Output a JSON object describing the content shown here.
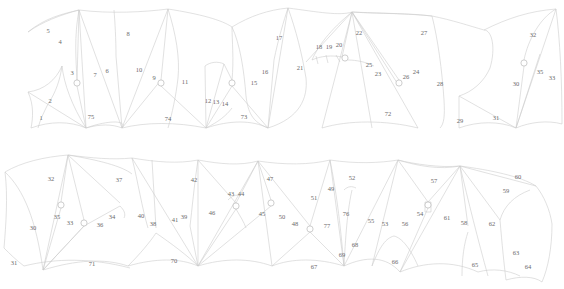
{
  "diagram": {
    "type": "panel-layout-drawing",
    "background_color": "#ffffff",
    "line_color": "#c9c9c9",
    "seam_color": "#a9a9a9",
    "label_color": "#6a6a6a",
    "width": 564,
    "height": 289,
    "rows": [
      {
        "name": "upper-row",
        "label": "Upper panel row"
      },
      {
        "name": "lower-row",
        "label": "Lower panel row"
      }
    ],
    "labels": [
      {
        "id": "1",
        "text": "1",
        "x": 41,
        "y": 118,
        "row": "upper-row"
      },
      {
        "id": "2",
        "text": "2",
        "x": 50,
        "y": 101,
        "row": "upper-row"
      },
      {
        "id": "3",
        "text": "3",
        "x": 72,
        "y": 73,
        "row": "upper-row"
      },
      {
        "id": "4",
        "text": "4",
        "x": 60,
        "y": 42,
        "row": "upper-row"
      },
      {
        "id": "5",
        "text": "5",
        "x": 48,
        "y": 31,
        "row": "upper-row"
      },
      {
        "id": "6",
        "text": "6",
        "x": 107,
        "y": 71,
        "row": "upper-row"
      },
      {
        "id": "7",
        "text": "7",
        "x": 95,
        "y": 75,
        "row": "upper-row"
      },
      {
        "id": "8",
        "text": "8",
        "x": 128,
        "y": 34,
        "row": "upper-row"
      },
      {
        "id": "9",
        "text": "9",
        "x": 154,
        "y": 78,
        "row": "upper-row"
      },
      {
        "id": "10",
        "text": "10",
        "x": 139,
        "y": 70,
        "row": "upper-row"
      },
      {
        "id": "11",
        "text": "11",
        "x": 185,
        "y": 82,
        "row": "upper-row"
      },
      {
        "id": "12",
        "text": "12",
        "x": 208,
        "y": 101,
        "row": "upper-row"
      },
      {
        "id": "13",
        "text": "13",
        "x": 216,
        "y": 102,
        "row": "upper-row"
      },
      {
        "id": "14",
        "text": "14",
        "x": 225,
        "y": 104,
        "row": "upper-row"
      },
      {
        "id": "15",
        "text": "15",
        "x": 254,
        "y": 83,
        "row": "upper-row"
      },
      {
        "id": "16",
        "text": "16",
        "x": 265,
        "y": 72,
        "row": "upper-row"
      },
      {
        "id": "17",
        "text": "17",
        "x": 279,
        "y": 38,
        "row": "upper-row"
      },
      {
        "id": "18",
        "text": "18",
        "x": 319,
        "y": 47,
        "row": "upper-row"
      },
      {
        "id": "19",
        "text": "19",
        "x": 329,
        "y": 47,
        "row": "upper-row"
      },
      {
        "id": "20",
        "text": "20",
        "x": 339,
        "y": 45,
        "row": "upper-row"
      },
      {
        "id": "21",
        "text": "21",
        "x": 300,
        "y": 68,
        "row": "upper-row"
      },
      {
        "id": "22",
        "text": "22",
        "x": 359,
        "y": 33,
        "row": "upper-row"
      },
      {
        "id": "23",
        "text": "23",
        "x": 378,
        "y": 74,
        "row": "upper-row"
      },
      {
        "id": "24",
        "text": "24",
        "x": 416,
        "y": 72,
        "row": "upper-row"
      },
      {
        "id": "25",
        "text": "25",
        "x": 369,
        "y": 65,
        "row": "upper-row"
      },
      {
        "id": "26",
        "text": "26",
        "x": 406,
        "y": 77,
        "row": "upper-row"
      },
      {
        "id": "27",
        "text": "27",
        "x": 424,
        "y": 33,
        "row": "upper-row"
      },
      {
        "id": "28",
        "text": "28",
        "x": 440,
        "y": 84,
        "row": "upper-row"
      },
      {
        "id": "29",
        "text": "29",
        "x": 460,
        "y": 121,
        "row": "upper-row"
      },
      {
        "id": "30",
        "text": "30",
        "x": 516,
        "y": 84,
        "row": "upper-row"
      },
      {
        "id": "31",
        "text": "31",
        "x": 496,
        "y": 118,
        "row": "upper-row"
      },
      {
        "id": "32",
        "text": "32",
        "x": 533,
        "y": 35,
        "row": "upper-row"
      },
      {
        "id": "33",
        "text": "33",
        "x": 552,
        "y": 78,
        "row": "upper-row"
      },
      {
        "id": "35",
        "text": "35",
        "x": 540,
        "y": 72,
        "row": "upper-row"
      },
      {
        "id": "30b",
        "text": "30",
        "x": 33,
        "y": 228,
        "row": "lower-row"
      },
      {
        "id": "31b",
        "text": "31",
        "x": 14,
        "y": 263,
        "row": "lower-row"
      },
      {
        "id": "32b",
        "text": "32",
        "x": 51,
        "y": 179,
        "row": "lower-row"
      },
      {
        "id": "33b",
        "text": "33",
        "x": 70,
        "y": 223,
        "row": "lower-row"
      },
      {
        "id": "34b",
        "text": "34",
        "x": 112,
        "y": 217,
        "row": "lower-row"
      },
      {
        "id": "35b",
        "text": "35",
        "x": 57,
        "y": 217,
        "row": "lower-row"
      },
      {
        "id": "36b",
        "text": "36",
        "x": 100,
        "y": 225,
        "row": "lower-row"
      },
      {
        "id": "37b",
        "text": "37",
        "x": 119,
        "y": 180,
        "row": "lower-row"
      },
      {
        "id": "38",
        "text": "38",
        "x": 153,
        "y": 224,
        "row": "lower-row"
      },
      {
        "id": "39",
        "text": "39",
        "x": 184,
        "y": 217,
        "row": "lower-row"
      },
      {
        "id": "40",
        "text": "40",
        "x": 141,
        "y": 216,
        "row": "lower-row"
      },
      {
        "id": "41",
        "text": "41",
        "x": 175,
        "y": 220,
        "row": "lower-row"
      },
      {
        "id": "42",
        "text": "42",
        "x": 194,
        "y": 180,
        "row": "lower-row"
      },
      {
        "id": "43",
        "text": "43",
        "x": 231,
        "y": 194,
        "row": "lower-row"
      },
      {
        "id": "44",
        "text": "44",
        "x": 241,
        "y": 194,
        "row": "lower-row"
      },
      {
        "id": "45",
        "text": "45",
        "x": 262,
        "y": 214,
        "row": "lower-row"
      },
      {
        "id": "46",
        "text": "46",
        "x": 212,
        "y": 213,
        "row": "lower-row"
      },
      {
        "id": "47",
        "text": "47",
        "x": 270,
        "y": 179,
        "row": "lower-row"
      },
      {
        "id": "48",
        "text": "48",
        "x": 295,
        "y": 224,
        "row": "lower-row"
      },
      {
        "id": "49",
        "text": "49",
        "x": 331,
        "y": 189,
        "row": "lower-row"
      },
      {
        "id": "50",
        "text": "50",
        "x": 282,
        "y": 217,
        "row": "lower-row"
      },
      {
        "id": "51",
        "text": "51",
        "x": 314,
        "y": 198,
        "row": "lower-row"
      },
      {
        "id": "52",
        "text": "52",
        "x": 352,
        "y": 178,
        "row": "lower-row"
      },
      {
        "id": "53",
        "text": "53",
        "x": 385,
        "y": 224,
        "row": "lower-row"
      },
      {
        "id": "54",
        "text": "54",
        "x": 420,
        "y": 214,
        "row": "lower-row"
      },
      {
        "id": "55",
        "text": "55",
        "x": 371,
        "y": 221,
        "row": "lower-row"
      },
      {
        "id": "56",
        "text": "56",
        "x": 405,
        "y": 224,
        "row": "lower-row"
      },
      {
        "id": "57",
        "text": "57",
        "x": 434,
        "y": 181,
        "row": "lower-row"
      },
      {
        "id": "58",
        "text": "58",
        "x": 464,
        "y": 223,
        "row": "lower-row"
      },
      {
        "id": "59",
        "text": "59",
        "x": 506,
        "y": 191,
        "row": "lower-row"
      },
      {
        "id": "60",
        "text": "60",
        "x": 518,
        "y": 177,
        "row": "lower-row"
      },
      {
        "id": "61",
        "text": "61",
        "x": 447,
        "y": 218,
        "row": "lower-row"
      },
      {
        "id": "62",
        "text": "62",
        "x": 492,
        "y": 224,
        "row": "lower-row"
      },
      {
        "id": "63",
        "text": "63",
        "x": 516,
        "y": 253,
        "row": "lower-row"
      },
      {
        "id": "64",
        "text": "64",
        "x": 528,
        "y": 267,
        "row": "lower-row"
      },
      {
        "id": "65",
        "text": "65",
        "x": 475,
        "y": 265,
        "row": "lower-row"
      },
      {
        "id": "66",
        "text": "66",
        "x": 395,
        "y": 262,
        "row": "lower-row"
      },
      {
        "id": "67",
        "text": "67",
        "x": 314,
        "y": 267,
        "row": "lower-row"
      },
      {
        "id": "68",
        "text": "68",
        "x": 355,
        "y": 245,
        "row": "lower-row"
      },
      {
        "id": "69",
        "text": "69",
        "x": 342,
        "y": 255,
        "row": "lower-row"
      },
      {
        "id": "70",
        "text": "70",
        "x": 174,
        "y": 261,
        "row": "lower-row"
      },
      {
        "id": "71",
        "text": "71",
        "x": 92,
        "y": 264,
        "row": "lower-row"
      },
      {
        "id": "76",
        "text": "76",
        "x": 346,
        "y": 214,
        "row": "lower-row"
      },
      {
        "id": "77",
        "text": "77",
        "x": 327,
        "y": 226,
        "row": "lower-row"
      },
      {
        "id": "72",
        "text": "72",
        "x": 388,
        "y": 114,
        "row": "upper-row"
      },
      {
        "id": "73",
        "text": "73",
        "x": 244,
        "y": 117,
        "row": "upper-row"
      },
      {
        "id": "74",
        "text": "74",
        "x": 168,
        "y": 119,
        "row": "upper-row"
      },
      {
        "id": "75",
        "text": "75",
        "x": 91,
        "y": 117,
        "row": "upper-row"
      }
    ],
    "nodes": [
      {
        "name": "node-upper-3",
        "x": 77,
        "y": 83,
        "r": 3.1
      },
      {
        "name": "node-upper-9",
        "x": 161,
        "y": 83,
        "r": 3.1
      },
      {
        "name": "node-upper-14",
        "x": 232,
        "y": 83,
        "r": 3.1
      },
      {
        "name": "node-upper-20",
        "x": 345,
        "y": 58,
        "r": 3.1
      },
      {
        "name": "node-upper-26",
        "x": 399,
        "y": 83,
        "r": 3.1
      },
      {
        "name": "node-upper-35",
        "x": 524,
        "y": 63,
        "r": 3.1
      },
      {
        "name": "node-lower-32",
        "x": 61,
        "y": 205,
        "r": 3.1
      },
      {
        "name": "node-lower-33",
        "x": 84,
        "y": 223,
        "r": 3.1
      },
      {
        "name": "node-lower-34",
        "x": 120,
        "y": 206,
        "r": 3.1
      },
      {
        "name": "node-lower-38",
        "x": 156,
        "y": 230,
        "r": 3.1
      },
      {
        "name": "node-lower-44",
        "x": 236,
        "y": 206,
        "r": 3.1
      },
      {
        "name": "node-lower-45",
        "x": 271,
        "y": 203,
        "r": 3.1
      },
      {
        "name": "node-lower-50",
        "x": 310,
        "y": 229,
        "r": 3.1
      },
      {
        "name": "node-lower-54",
        "x": 428,
        "y": 205,
        "r": 3.1
      },
      {
        "name": "node-lower-58",
        "x": 468,
        "y": 229,
        "r": 3.1
      }
    ]
  }
}
